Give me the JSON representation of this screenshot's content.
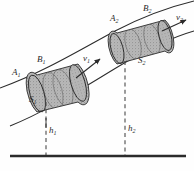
{
  "figure": {
    "background_color": "#fefefe",
    "ink_color": "#2b2b2b",
    "fill_color": "#b3b3b3",
    "width": 194,
    "height": 171
  },
  "labels": {
    "a1": "A",
    "a1_sub": "1",
    "b1": "B",
    "b1_sub": "1",
    "s1": "S",
    "s1_sub": "1",
    "v1": "v",
    "v1_sub": "1",
    "a2": "A",
    "a2_sub": "2",
    "b2": "B",
    "b2_sub": "2",
    "s2": "S",
    "s2_sub": "2",
    "v2": "v",
    "v2_sub": "2",
    "h1": "h",
    "h1_sub": "1",
    "h2": "h",
    "h2_sub": "2"
  },
  "elements": {
    "pipe_upper_wall": "upper curved pipe boundary",
    "pipe_lower_wall": "lower curved pipe boundary",
    "cylinder_left": "shaded fluid element at section 1",
    "cylinder_right": "shaded fluid element at section 2",
    "velocity_arrow_1": "velocity vector v1",
    "velocity_arrow_2": "velocity vector v2",
    "height_line_1": "dashed height reference h1",
    "height_line_2": "dashed height reference h2",
    "ground_line": "datum reference ground line"
  }
}
